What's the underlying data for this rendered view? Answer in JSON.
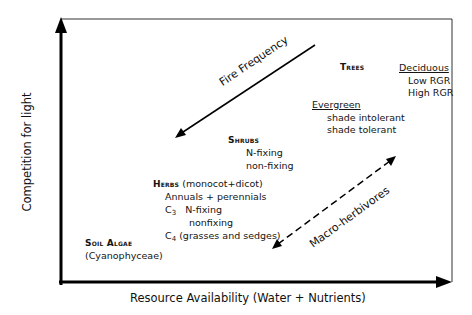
{
  "diagram": {
    "axes": {
      "x_label": "Resource Availability (Water + Nutrients)",
      "y_label": "Competition for light"
    },
    "arrows": {
      "fire_frequency": {
        "label": "Fire Frequency",
        "style": "solid",
        "direction": "toward lower-left"
      },
      "macro_herbivores": {
        "label": "Macro-herbivores",
        "style": "dashed",
        "direction": "bidirectional"
      }
    },
    "groups": {
      "trees": {
        "title": "Trees",
        "deciduous": {
          "title": "Deciduous",
          "items": [
            "Low RGR",
            "High RGR"
          ]
        },
        "evergreen": {
          "title": "Evergreen",
          "items": [
            "shade intolerant",
            "shade tolerant"
          ]
        }
      },
      "shrubs": {
        "title": "Shrubs",
        "items": [
          "N-fixing",
          "non-fixing"
        ]
      },
      "herbs": {
        "title": "Herbs",
        "subtitle": "(monocot+dicot)",
        "line1": "Annuals + perennials",
        "c3_prefix": "C",
        "c3_sub": "3",
        "c3_item1": "N-fixing",
        "c3_item2": "nonfixing",
        "c4_prefix": "C",
        "c4_sub": "4",
        "c4_text": "(grasses and sedges)"
      },
      "soil_algae": {
        "title": "Soil Algae",
        "subtitle": "(Cyanophyceae)"
      }
    },
    "colors": {
      "line": "#000000",
      "text": "#141414",
      "background": "#ffffff"
    }
  }
}
